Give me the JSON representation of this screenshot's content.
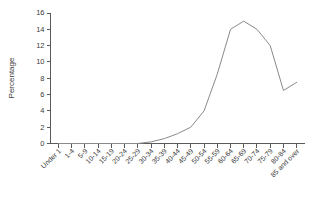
{
  "chart_data": {
    "type": "line",
    "title": "",
    "subtitle": "",
    "xlabel": "",
    "ylabel": "Percentage",
    "categories": [
      "Under 1",
      "1-4",
      "5-9",
      "10-14",
      "15-19",
      "20-24",
      "25-29",
      "30-34",
      "35-39",
      "40-44",
      "45-49",
      "50-54",
      "55-59",
      "60-64",
      "65-69",
      "70-74",
      "75-79",
      "80-84",
      "85 and over"
    ],
    "values": [
      0,
      0,
      0,
      0,
      0,
      0,
      0,
      0.2,
      0.6,
      1.2,
      2.0,
      4.0,
      8.5,
      14.0,
      15.0,
      14.0,
      12.0,
      6.5,
      7.5
    ],
    "ylim": [
      0,
      16
    ],
    "ytick_labels": [
      "0",
      "2",
      "4",
      "6",
      "8",
      "10",
      "12",
      "14",
      "16"
    ],
    "ytick_values": [
      0,
      2,
      4,
      6,
      8,
      10,
      12,
      14,
      16
    ],
    "grid": false,
    "legend": false,
    "legend_position": "none",
    "series_color": "#8a8a8a",
    "axis_color": "#5a5a5a",
    "background_color": "#ffffff",
    "xtick_label_rotation": -45
  }
}
